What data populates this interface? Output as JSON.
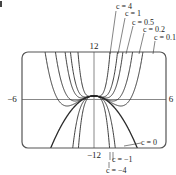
{
  "chart_data": {
    "type": "line",
    "title": "",
    "function": "y = c*x^4 - x^2 + 1",
    "xlabel": "",
    "ylabel": "",
    "xlim": [
      -6,
      6
    ],
    "ylim": [
      -12,
      12
    ],
    "tick_labels": {
      "x_min": "−6",
      "x_max": "6",
      "y_max": "12",
      "y_min": "−12"
    },
    "grid": false,
    "series": [
      {
        "name": "c = 4",
        "c": 4
      },
      {
        "name": "c = 1",
        "c": 1
      },
      {
        "name": "c = 0.5",
        "c": 0.5
      },
      {
        "name": "c = 0.2",
        "c": 0.2
      },
      {
        "name": "c = 0.1",
        "c": 0.1
      },
      {
        "name": "c = 0",
        "c": 0
      },
      {
        "name": "c = −1",
        "c": -1
      },
      {
        "name": "c = −4",
        "c": -4
      }
    ],
    "annotations": {
      "top": [
        "c = 4",
        "c = 1",
        "c = 0.5",
        "c = 0.2",
        "c = 0.1"
      ],
      "right": [
        "c = 0"
      ],
      "bottom": [
        "c = −1",
        "c = −4"
      ]
    }
  },
  "colors": {
    "curve": "#2a2a2a",
    "axis": "#888888",
    "frame": "#555555"
  }
}
